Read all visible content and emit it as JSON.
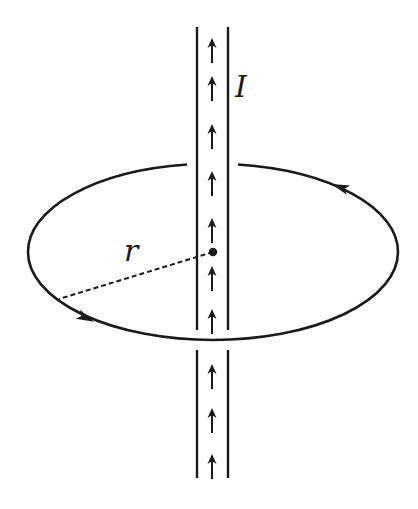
{
  "figure": {
    "labels": {
      "current": "I",
      "radius": "r"
    },
    "colors": {
      "ink": "#1a1a1a",
      "background": "#ffffff"
    },
    "wire": {
      "left_x": 197,
      "right_x": 228,
      "top_y": 27,
      "bottom_y": 478,
      "gap_upper_end_y": 330,
      "gap_lower_start_y": 350,
      "current_direction": "up",
      "arrow_icon": "arrow-up-icon",
      "arrow_count": 10
    },
    "loop": {
      "shape": "ellipse",
      "center": [
        213,
        252
      ],
      "rx": 185,
      "ry": 88,
      "direction": "counterclockwise (viewed from above)",
      "arrow_icons": [
        "arrowhead-upper-right-icon",
        "arrowhead-lower-left-icon"
      ]
    },
    "center_point": {
      "x": 213,
      "y": 252
    },
    "radius_line": {
      "style": "dashed",
      "from": [
        213,
        252
      ],
      "to": [
        59,
        299
      ]
    }
  }
}
